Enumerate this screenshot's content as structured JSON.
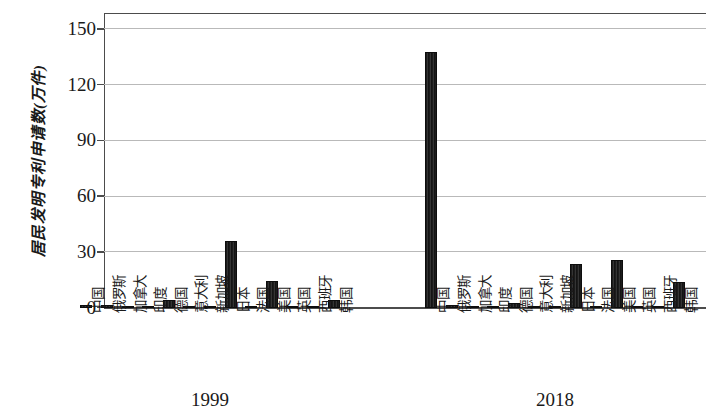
{
  "chart_data": {
    "type": "bar",
    "title": "",
    "subtitle": "",
    "xlabel": "",
    "ylabel": "居民发明专利申请数(万件)",
    "ylim": [
      0,
      157
    ],
    "yticks": [
      0,
      30,
      60,
      90,
      120,
      150
    ],
    "ytick_labels": [
      "0",
      "30",
      "60",
      "90",
      "120",
      "150"
    ],
    "grid": "horizontal",
    "legend": "none",
    "bar_color": "#1f1f1f",
    "axis_color": "#4c4c4c",
    "grid_color": "#b9b9b9",
    "categories": [
      "中国",
      "俄罗斯",
      "加拿大",
      "印度",
      "德国",
      "意大利",
      "新加坡",
      "日本",
      "法国",
      "美国",
      "英国",
      "西班牙",
      "韩国"
    ],
    "groups": [
      "1999",
      "2018"
    ],
    "series": [
      {
        "name": "1999",
        "values": [
          1.5,
          1.8,
          0.3,
          0.3,
          4.5,
          0.3,
          0.2,
          36.0,
          1.2,
          14.5,
          1.3,
          0.2,
          4.5
        ]
      },
      {
        "name": "2018",
        "values": [
          138.0,
          1.5,
          0.4,
          0.5,
          2.6,
          0.4,
          0.1,
          23.8,
          1.2,
          25.8,
          1.2,
          0.1,
          14.0
        ]
      }
    ]
  }
}
